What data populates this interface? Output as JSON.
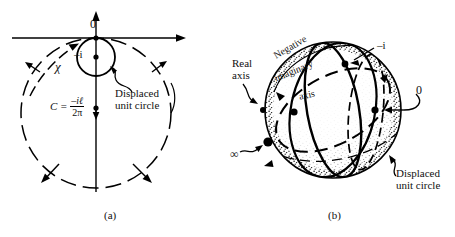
{
  "figure": {
    "stroke_color": "#000000",
    "fill_color": "#ffffff",
    "stipple_color": "#2b2b2b"
  },
  "panel_a": {
    "caption": "(a)",
    "origin_label": "0",
    "minus_i_label": "–i",
    "chi_label": "χ",
    "formula": {
      "lhs": "C =",
      "numerator": "–iℓ",
      "denominator": "2π"
    },
    "annotation": {
      "line1": "Displaced",
      "line2": "unit circle"
    }
  },
  "panel_b": {
    "caption": "(b)",
    "real_axis": {
      "line1": "Real",
      "line2": "axis"
    },
    "negative_imaginary_axis": {
      "word1": "Negative",
      "word2": "imaginary",
      "word3": "axis"
    },
    "infinity_label": "∞",
    "minus_i_label": "–i",
    "zero_label": "0",
    "annotation": {
      "line1": "Displaced",
      "line2": "unit circle"
    }
  }
}
